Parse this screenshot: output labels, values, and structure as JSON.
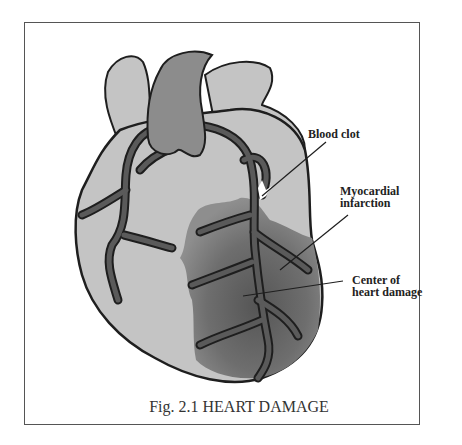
{
  "figure": {
    "caption": "Fig. 2.1  HEART DAMAGE",
    "labels": {
      "blood_clot": "Blood clot",
      "myocardial_line1": "Myocardial",
      "myocardial_line2": "infarction",
      "center_line1": "Center of",
      "center_line2": "heart damage"
    },
    "colors": {
      "heart_fill": "#c4c4c4",
      "aorta_fill": "#8c8c8c",
      "vessel_fill": "#555555",
      "outline": "#1e1e1e",
      "damage_outer": "#8a8a8a",
      "damage_center": "#5a5a5a",
      "clot": "#ffffff",
      "frame_border": "#555555"
    }
  }
}
